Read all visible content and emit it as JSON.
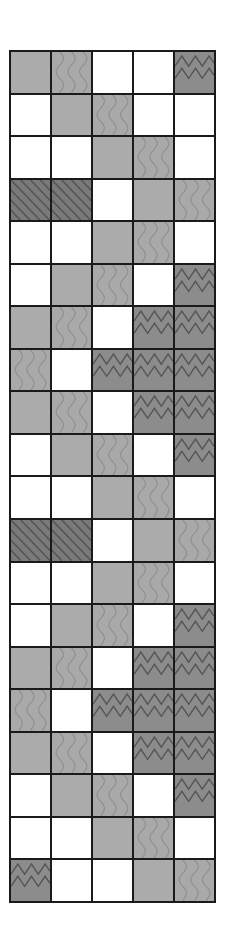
{
  "figure": {
    "columns": 5,
    "rows": 20,
    "legend_codes": {
      "W": "white-empty",
      "G": "light-gray-stipple",
      "V": "light-gray-vertical-wavy",
      "Z": "dark-gray-horizontal-zigzag",
      "D": "dark-gray-diagonal-hatch"
    },
    "colors": {
      "W": "#ffffff",
      "G": "#ababab",
      "V": "#a9a9a9",
      "Z": "#8c8c8c",
      "D": "#7a7a7a",
      "line": "#1a1a1a",
      "pattern_dark": "#555555",
      "pattern_light": "#8f8f8f"
    },
    "grid": [
      [
        "G",
        "V",
        "W",
        "W",
        "Z"
      ],
      [
        "W",
        "G",
        "V",
        "W",
        "W"
      ],
      [
        "W",
        "W",
        "G",
        "V",
        "W"
      ],
      [
        "D",
        "D",
        "W",
        "G",
        "V"
      ],
      [
        "W",
        "W",
        "G",
        "V",
        "W"
      ],
      [
        "W",
        "G",
        "V",
        "W",
        "Z"
      ],
      [
        "G",
        "V",
        "W",
        "Z",
        "Z"
      ],
      [
        "V",
        "W",
        "Z",
        "Z",
        "Z"
      ],
      [
        "G",
        "V",
        "W",
        "Z",
        "Z"
      ],
      [
        "W",
        "G",
        "V",
        "W",
        "Z"
      ],
      [
        "W",
        "W",
        "G",
        "V",
        "W"
      ],
      [
        "D",
        "D",
        "W",
        "G",
        "V"
      ],
      [
        "W",
        "W",
        "G",
        "V",
        "W"
      ],
      [
        "W",
        "G",
        "V",
        "W",
        "Z"
      ],
      [
        "G",
        "V",
        "W",
        "Z",
        "Z"
      ],
      [
        "V",
        "W",
        "Z",
        "Z",
        "Z"
      ],
      [
        "G",
        "V",
        "W",
        "Z",
        "Z"
      ],
      [
        "W",
        "G",
        "V",
        "W",
        "Z"
      ],
      [
        "W",
        "W",
        "G",
        "V",
        "W"
      ],
      [
        "Z",
        "W",
        "W",
        "G",
        "V"
      ]
    ]
  }
}
